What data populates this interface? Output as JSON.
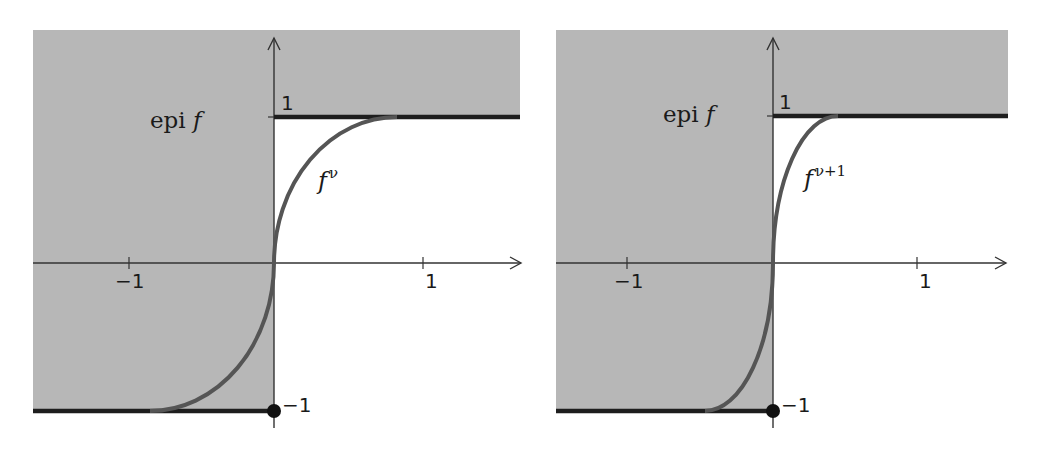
{
  "colors": {
    "background": "#ffffff",
    "epigraph_fill": "#b7b7b7",
    "axis": "#333333",
    "curve": "#555555",
    "limit_line": "#1e1e1e",
    "dot": "#111111"
  },
  "panels": [
    {
      "id": "left",
      "region_label": "epi",
      "region_label_fn": "f",
      "curve_label_base": "f",
      "curve_label_sup": "ν",
      "x_ticks": [
        {
          "value": -1,
          "label": "−1"
        },
        {
          "value": 1,
          "label": "1"
        }
      ],
      "y_ticks": [
        {
          "value": 1,
          "label": "1"
        },
        {
          "value": -1,
          "label": "−1"
        }
      ]
    },
    {
      "id": "right",
      "region_label": "epi",
      "region_label_fn": "f",
      "curve_label_base": "f",
      "curve_label_sup": "ν+1",
      "x_ticks": [
        {
          "value": -1,
          "label": "−1"
        },
        {
          "value": 1,
          "label": "1"
        }
      ],
      "y_ticks": [
        {
          "value": 1,
          "label": "1"
        },
        {
          "value": -1,
          "label": "−1"
        }
      ]
    }
  ]
}
